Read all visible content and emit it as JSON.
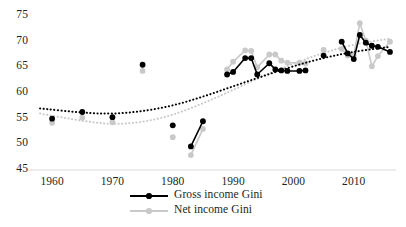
{
  "chart_data": {
    "type": "scatter",
    "title": "",
    "subtitle": "",
    "xlabel": "",
    "ylabel": "",
    "xlim": [
      1957,
      2017
    ],
    "ylim": [
      45,
      75
    ],
    "xticks": [
      1960,
      1970,
      1980,
      1990,
      2000,
      2010
    ],
    "yticks": [
      45,
      50,
      55,
      60,
      65,
      70,
      75
    ],
    "grid": false,
    "legend_position": "bottom-center",
    "axis_color": "#d9d9d9",
    "series": [
      {
        "name": "Gross income Gini",
        "color": "#000000",
        "marker": "circle",
        "values": [
          {
            "x": 1960,
            "y": 55.0
          },
          {
            "x": 1965,
            "y": 56.3
          },
          {
            "x": 1970,
            "y": 55.3
          },
          {
            "x": 1975,
            "y": 65.5
          },
          {
            "x": 1980,
            "y": 53.7
          },
          {
            "x": 1983,
            "y": 49.6
          },
          {
            "x": 1985,
            "y": 54.5
          },
          {
            "x": 1989,
            "y": 63.6
          },
          {
            "x": 1990,
            "y": 64.1
          },
          {
            "x": 1992,
            "y": 66.8
          },
          {
            "x": 1993,
            "y": 66.8
          },
          {
            "x": 1994,
            "y": 63.6
          },
          {
            "x": 1996,
            "y": 65.8
          },
          {
            "x": 1997,
            "y": 64.6
          },
          {
            "x": 1998,
            "y": 64.4
          },
          {
            "x": 1999,
            "y": 64.3
          },
          {
            "x": 2001,
            "y": 64.3
          },
          {
            "x": 2002,
            "y": 64.4
          },
          {
            "x": 2005,
            "y": 67.3
          },
          {
            "x": 2008,
            "y": 70.0
          },
          {
            "x": 2009,
            "y": 67.7
          },
          {
            "x": 2010,
            "y": 66.6
          },
          {
            "x": 2011,
            "y": 71.3
          },
          {
            "x": 2012,
            "y": 69.8
          },
          {
            "x": 2013,
            "y": 69.2
          },
          {
            "x": 2014,
            "y": 69.0
          },
          {
            "x": 2016,
            "y": 68.0
          }
        ],
        "trend": [
          {
            "x": 1958,
            "y": 57.0
          },
          {
            "x": 1965,
            "y": 56.2
          },
          {
            "x": 1970,
            "y": 56.0
          },
          {
            "x": 1975,
            "y": 56.5
          },
          {
            "x": 1980,
            "y": 57.6
          },
          {
            "x": 1985,
            "y": 59.3
          },
          {
            "x": 1990,
            "y": 61.3
          },
          {
            "x": 1995,
            "y": 63.3
          },
          {
            "x": 2000,
            "y": 65.2
          },
          {
            "x": 2005,
            "y": 66.8
          },
          {
            "x": 2010,
            "y": 68.0
          },
          {
            "x": 2016,
            "y": 69.0
          }
        ]
      },
      {
        "name": "Net income Gini",
        "color": "#c9c9c9",
        "marker": "circle",
        "values": [
          {
            "x": 1960,
            "y": 54.2
          },
          {
            "x": 1965,
            "y": 55.2
          },
          {
            "x": 1970,
            "y": 54.3
          },
          {
            "x": 1975,
            "y": 64.3
          },
          {
            "x": 1980,
            "y": 51.4
          },
          {
            "x": 1983,
            "y": 47.9
          },
          {
            "x": 1985,
            "y": 53.0
          },
          {
            "x": 1989,
            "y": 64.6
          },
          {
            "x": 1990,
            "y": 66.1
          },
          {
            "x": 1992,
            "y": 68.3
          },
          {
            "x": 1993,
            "y": 68.2
          },
          {
            "x": 1994,
            "y": 65.0
          },
          {
            "x": 1996,
            "y": 67.5
          },
          {
            "x": 1997,
            "y": 67.5
          },
          {
            "x": 1998,
            "y": 66.3
          },
          {
            "x": 1999,
            "y": 65.9
          },
          {
            "x": 2001,
            "y": 65.9
          },
          {
            "x": 2002,
            "y": 65.8
          },
          {
            "x": 2005,
            "y": 68.4
          },
          {
            "x": 2008,
            "y": 68.6
          },
          {
            "x": 2009,
            "y": 67.3
          },
          {
            "x": 2010,
            "y": 67.4
          },
          {
            "x": 2011,
            "y": 73.6
          },
          {
            "x": 2012,
            "y": 70.2
          },
          {
            "x": 2013,
            "y": 65.2
          },
          {
            "x": 2014,
            "y": 67.2
          },
          {
            "x": 2016,
            "y": 70.0
          }
        ],
        "trend": [
          {
            "x": 1958,
            "y": 56.0
          },
          {
            "x": 1965,
            "y": 54.6
          },
          {
            "x": 1970,
            "y": 54.0
          },
          {
            "x": 1975,
            "y": 54.4
          },
          {
            "x": 1980,
            "y": 55.8
          },
          {
            "x": 1985,
            "y": 58.0
          },
          {
            "x": 1990,
            "y": 60.6
          },
          {
            "x": 1995,
            "y": 63.3
          },
          {
            "x": 2000,
            "y": 65.7
          },
          {
            "x": 2005,
            "y": 67.8
          },
          {
            "x": 2010,
            "y": 69.4
          },
          {
            "x": 2016,
            "y": 70.6
          }
        ]
      }
    ],
    "legend": [
      {
        "label": "Gross income Gini",
        "color": "#000000"
      },
      {
        "label": "Net income Gini",
        "color": "#c9c9c9"
      }
    ]
  }
}
